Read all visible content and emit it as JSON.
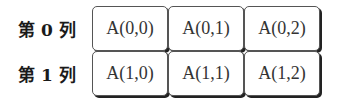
{
  "rows": [
    {
      "label": "第 0 列",
      "cells": [
        "A(0,0)",
        "A(0,1)",
        "A(0,2)"
      ]
    },
    {
      "label": "第 1 列",
      "cells": [
        "A(1,0)",
        "A(1,1)",
        "A(1,2)"
      ]
    }
  ]
}
